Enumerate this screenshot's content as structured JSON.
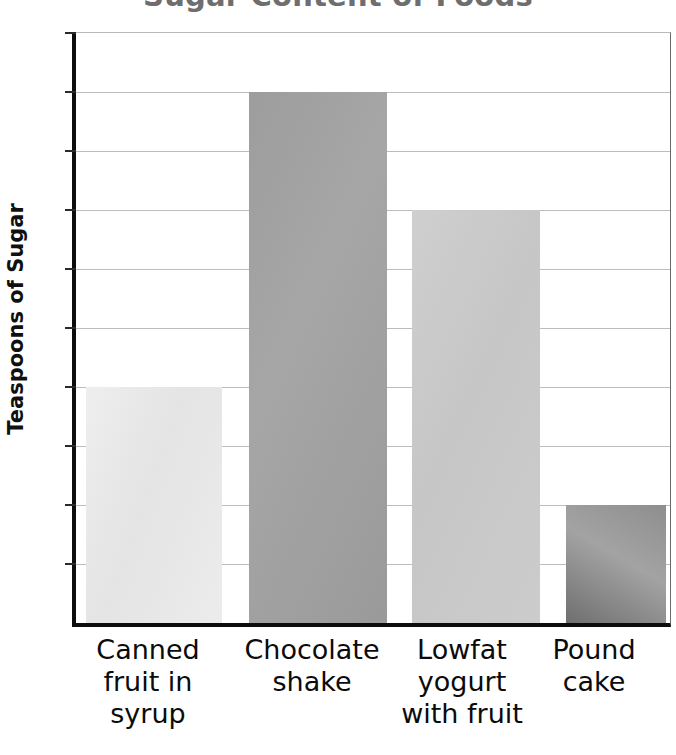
{
  "chart_data": {
    "type": "bar",
    "title": "Sugar Content of Foods",
    "xlabel": "",
    "ylabel": "Teaspoons of Sugar",
    "categories": [
      "Canned fruit in syrup",
      "Chocolate shake",
      "Lowfat yogurt with fruit",
      "Pound cake"
    ],
    "category_lines": [
      [
        "Canned",
        "fruit in",
        "syrup"
      ],
      [
        "Chocolate",
        "shake"
      ],
      [
        "Lowfat",
        "yogurt",
        "with fruit"
      ],
      [
        "Pound",
        "cake"
      ]
    ],
    "values": [
      4,
      9,
      7,
      2
    ],
    "ylim": [
      0,
      10
    ],
    "ytick_labels": [
      "10",
      "9",
      "8",
      "7",
      "6",
      "5",
      "4",
      "3",
      "2",
      "1",
      "0"
    ],
    "ytick_values": [
      10,
      9,
      8,
      7,
      6,
      5,
      4,
      3,
      2,
      1,
      0
    ],
    "grid": true,
    "legend": "none",
    "bar_colors": [
      "#e8e8e8",
      "#a0a0a0",
      "#c8c8c8",
      "#8c8c8c"
    ],
    "title_color": "#6e6e70",
    "axis_color": "#0d0d0d",
    "gridline_color": "#bcbcbc"
  }
}
